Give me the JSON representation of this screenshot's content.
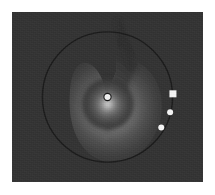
{
  "figure": {
    "title": "",
    "background_color": "#ffffff",
    "plot_background_color": "#333333",
    "plot_rect": {
      "x": 12,
      "y": 12,
      "width": 191,
      "height": 170
    }
  },
  "chart_data": {
    "type": "scatter",
    "title": "",
    "subtitle": "",
    "xlabel": "",
    "ylabel": "",
    "xlim": [
      -1.35,
      1.35
    ],
    "ylim": [
      -1.2,
      1.2
    ],
    "grid": false,
    "legend_position": "none",
    "colormap": "gray",
    "series": [
      {
        "name": "orbit-circle",
        "type": "line",
        "color": "#1a1a1a",
        "linewidth": 1.4,
        "center": [
          0.0,
          0.0
        ],
        "radius": 0.92,
        "closed": true
      },
      {
        "name": "point-source",
        "type": "scatter",
        "marker": "circle",
        "color": "#f2f2f2",
        "edge_color": "#141414",
        "size": 7,
        "points": [
          {
            "x": 0.0,
            "y": 0.0,
            "label": ""
          }
        ]
      },
      {
        "name": "marker-square",
        "type": "scatter",
        "marker": "square",
        "color": "#f7f7f7",
        "edge_color": "#f7f7f7",
        "size": 7,
        "points": [
          {
            "x": 0.925,
            "y": 0.045,
            "label": ""
          }
        ]
      },
      {
        "name": "marker-circles",
        "type": "scatter",
        "marker": "circle",
        "color": "#f7f7f7",
        "edge_color": "#f7f7f7",
        "size": 6,
        "points": [
          {
            "x": 0.885,
            "y": -0.215,
            "label": ""
          },
          {
            "x": 0.76,
            "y": -0.43,
            "label": ""
          }
        ]
      }
    ],
    "field": {
      "name": "intensity-lobe",
      "type": "heatmap",
      "shape": "teardrop",
      "peak_value": 1.0,
      "peak_at": [
        0.0,
        0.0
      ],
      "min_value": 0.0,
      "apex_at": [
        0.5,
        1.02
      ],
      "lobe_center": [
        0.1,
        -0.08
      ],
      "lobe_radius": 0.72,
      "wedge_color_dark": "#2a2a2a",
      "wedge_color_light": "#cfcfcf"
    }
  }
}
